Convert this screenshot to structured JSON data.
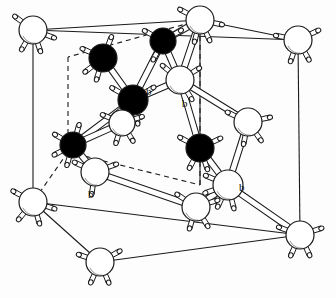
{
  "figure": {
    "kind": "crystal-structure-unit-cell",
    "background_color": "#ffffff",
    "line_color": "#1a1a1a",
    "atom_fill_light": "#ffffff",
    "atom_fill_dark": "#000000",
    "bond_fill": "#ffffff"
  },
  "labels": [
    {
      "text": "b",
      "x": 146,
      "y": 86
    },
    {
      "text": "b",
      "x": 182,
      "y": 98
    },
    {
      "text": "b",
      "x": 88,
      "y": 189
    },
    {
      "text": "b",
      "x": 239,
      "y": 182
    }
  ],
  "cell": {
    "solid_edges": [
      [
        33,
        30,
        298,
        40
      ],
      [
        33,
        30,
        33,
        202
      ],
      [
        298,
        40,
        300,
        235
      ],
      [
        33,
        202,
        100,
        262
      ],
      [
        100,
        262,
        300,
        235
      ],
      [
        33,
        202,
        300,
        235
      ],
      [
        33,
        30,
        200,
        20
      ],
      [
        298,
        40,
        200,
        20
      ],
      [
        200,
        20,
        200,
        185
      ]
    ],
    "dashed_edges": [
      [
        200,
        20,
        68,
        57
      ],
      [
        68,
        57,
        68,
        152
      ],
      [
        68,
        152,
        200,
        185
      ],
      [
        200,
        185,
        200,
        20
      ],
      [
        68,
        152,
        33,
        202
      ]
    ]
  },
  "atoms": [
    {
      "id": "c-tl-top",
      "x": 33,
      "y": 30,
      "r": 14,
      "shade": "light",
      "hydrogens": [
        [
          -1,
          -0.75
        ],
        [
          0.95,
          0.35
        ],
        [
          -0.55,
          0.95
        ],
        [
          0.35,
          1.0
        ]
      ]
    },
    {
      "id": "c-back-top",
      "x": 200,
      "y": 20,
      "r": 14,
      "shade": "light",
      "hydrogens": [
        [
          -0.95,
          -0.5
        ],
        [
          0.95,
          0.2
        ],
        [
          -0.25,
          1.0
        ],
        [
          0.45,
          0.95
        ]
      ]
    },
    {
      "id": "c-tr-top",
      "x": 298,
      "y": 40,
      "r": 14,
      "shade": "light",
      "hydrogens": [
        [
          -1,
          -0.2
        ],
        [
          0.95,
          -0.45
        ],
        [
          -0.35,
          1.0
        ],
        [
          0.5,
          0.9
        ]
      ]
    },
    {
      "id": "c-bl-front",
      "x": 33,
      "y": 202,
      "r": 14,
      "shade": "light",
      "hydrogens": [
        [
          -1,
          -0.55
        ],
        [
          0.95,
          0.3
        ],
        [
          -0.7,
          0.85
        ],
        [
          0.3,
          1.0
        ]
      ]
    },
    {
      "id": "c-bottom-fr",
      "x": 100,
      "y": 262,
      "r": 14,
      "shade": "light",
      "hydrogens": [
        [
          -1,
          -0.35
        ],
        [
          0.9,
          -0.5
        ],
        [
          -0.45,
          1.0
        ],
        [
          0.4,
          0.95
        ]
      ]
    },
    {
      "id": "c-br-front",
      "x": 300,
      "y": 235,
      "r": 14,
      "shade": "light",
      "hydrogens": [
        [
          -0.95,
          -0.35
        ],
        [
          0.95,
          -0.3
        ],
        [
          -0.45,
          1.0
        ],
        [
          0.45,
          0.95
        ]
      ]
    },
    {
      "id": "d-upper-l",
      "x": 103,
      "y": 58,
      "r": 14,
      "shade": "dark",
      "hydrogens": [
        [
          -1,
          -0.45
        ],
        [
          0.4,
          -1.0
        ],
        [
          -0.9,
          0.7
        ],
        [
          -0.3,
          1.0
        ]
      ]
    },
    {
      "id": "d-back-r",
      "x": 163,
      "y": 41,
      "r": 13,
      "shade": "dark",
      "hydrogens": [
        [
          -0.9,
          -0.5
        ],
        [
          0.85,
          -0.5
        ],
        [
          -0.5,
          0.95
        ]
      ]
    },
    {
      "id": "d-center",
      "x": 133,
      "y": 100,
      "r": 15,
      "shade": "dark",
      "hydrogens": [
        [
          -0.95,
          -0.55
        ],
        [
          0.9,
          -0.55
        ],
        [
          -0.85,
          0.7
        ],
        [
          0.2,
          1.0
        ]
      ]
    },
    {
      "id": "d-left-mid",
      "x": 73,
      "y": 145,
      "r": 13,
      "shade": "dark",
      "hydrogens": [
        [
          -0.95,
          -0.55
        ],
        [
          0.3,
          -1.0
        ],
        [
          -0.95,
          0.5
        ],
        [
          -0.3,
          1.0
        ]
      ]
    },
    {
      "id": "d-right-mid",
      "x": 200,
      "y": 148,
      "r": 14,
      "shade": "dark",
      "hydrogens": [
        [
          -0.95,
          -0.5
        ],
        [
          0.95,
          -0.45
        ],
        [
          -0.5,
          0.95
        ],
        [
          0.35,
          1.0
        ]
      ]
    },
    {
      "id": "w-upper-r",
      "x": 180,
      "y": 80,
      "r": 14,
      "shade": "light",
      "hydrogens": [
        [
          -0.85,
          -0.7
        ],
        [
          0.9,
          -0.55
        ],
        [
          0.55,
          0.9
        ]
      ]
    },
    {
      "id": "w-mid-l",
      "x": 122,
      "y": 123,
      "r": 13,
      "shade": "light",
      "hydrogens": [
        [
          -0.95,
          -0.4
        ],
        [
          0.95,
          -0.3
        ],
        [
          -0.3,
          1.0
        ],
        [
          0.55,
          0.9
        ]
      ]
    },
    {
      "id": "w-low-l",
      "x": 95,
      "y": 172,
      "r": 14,
      "shade": "light",
      "hydrogens": [
        [
          -0.95,
          -0.45
        ],
        [
          0.95,
          -0.35
        ],
        [
          -0.15,
          1.0
        ]
      ]
    },
    {
      "id": "w-right-up",
      "x": 248,
      "y": 122,
      "r": 14,
      "shade": "light",
      "hydrogens": [
        [
          -0.95,
          -0.45
        ],
        [
          0.95,
          -0.2
        ],
        [
          -0.2,
          1.0
        ],
        [
          0.6,
          0.85
        ]
      ]
    },
    {
      "id": "w-right-low",
      "x": 228,
      "y": 185,
      "r": 15,
      "shade": "light",
      "hydrogens": [
        [
          -0.95,
          -0.4
        ],
        [
          -1,
          0.35
        ],
        [
          -0.45,
          0.95
        ],
        [
          0.25,
          1.0
        ]
      ]
    },
    {
      "id": "w-bot-mid",
      "x": 196,
      "y": 207,
      "r": 14,
      "shade": "light",
      "hydrogens": [
        [
          -0.9,
          -0.6
        ],
        [
          0.95,
          -0.3
        ],
        [
          -0.3,
          1.0
        ],
        [
          0.55,
          0.9
        ]
      ]
    }
  ],
  "bonds": [
    [
      "d-upper-l",
      "d-center"
    ],
    [
      "d-back-r",
      "d-center"
    ],
    [
      "d-back-r",
      "w-upper-r"
    ],
    [
      "d-center",
      "w-upper-r"
    ],
    [
      "d-center",
      "w-mid-l"
    ],
    [
      "d-center",
      "d-left-mid"
    ],
    [
      "w-mid-l",
      "d-left-mid"
    ],
    [
      "d-left-mid",
      "w-low-l"
    ],
    [
      "w-upper-r",
      "d-right-mid"
    ],
    [
      "w-upper-r",
      "w-right-up"
    ],
    [
      "d-right-mid",
      "w-right-low"
    ],
    [
      "w-right-up",
      "w-right-low"
    ],
    [
      "w-low-l",
      "w-bot-mid"
    ],
    [
      "w-bot-mid",
      "w-right-low"
    ],
    [
      "w-right-low",
      "c-br-front"
    ],
    [
      "d-back-r",
      "c-back-top"
    ],
    [
      "w-upper-r",
      "c-back-top"
    ]
  ]
}
